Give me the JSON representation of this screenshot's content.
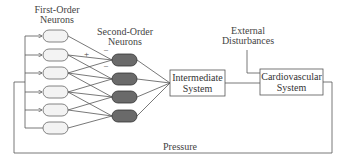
{
  "labels": {
    "first_order_line1": "First-Order",
    "first_order_line2": "Neurons",
    "second_order_line1": "Second-Order",
    "second_order_line2": "Neurons",
    "external_line1": "External",
    "external_line2": "Disturbances",
    "pressure": "Pressure",
    "plus_sign": "+",
    "minus_sign_1": "–",
    "minus_sign_2": "–"
  },
  "boxes": {
    "intermediate_line1": "Intermediate",
    "intermediate_line2": "System",
    "cardio_line1": "Cardiovascular",
    "cardio_line2": "System"
  },
  "nodes": {
    "first_order_count": 6,
    "second_order_count": 4
  },
  "colors": {
    "line": "#555555",
    "first_fill": "#f3f3f3",
    "second_fill": "#6a6a6a"
  }
}
